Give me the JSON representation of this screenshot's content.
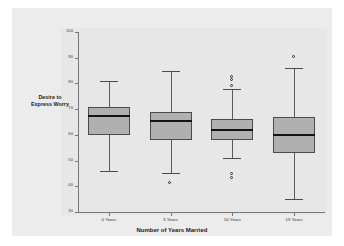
{
  "chart_data": {
    "type": "box",
    "title": "",
    "xlabel": "Number of Years Married",
    "ylabel": "Desire to Express Worry",
    "ylim": [
      30,
      100
    ],
    "yticks": [
      100,
      90,
      80,
      70,
      60,
      50,
      40,
      30
    ],
    "ytick_labels": [
      "100",
      "90",
      "80",
      "70",
      "60",
      "50",
      "40",
      "30"
    ],
    "grid": false,
    "legend": "none",
    "categories": [
      "0 Years",
      "5 Years",
      "10 Years",
      "15 Years"
    ],
    "boxes": [
      {
        "category": "0 Years",
        "whisker_low": 46,
        "q1": 60,
        "median": 67.5,
        "q3": 71,
        "whisker_high": 81,
        "outliers": []
      },
      {
        "category": "5 Years",
        "whisker_low": 45,
        "q1": 58,
        "median": 65.5,
        "q3": 69,
        "whisker_high": 85,
        "outliers": [
          41
        ]
      },
      {
        "category": "10 Years",
        "whisker_low": 51,
        "q1": 58,
        "median": 62,
        "q3": 66,
        "whisker_high": 78,
        "outliers": [
          82.5,
          81,
          79,
          44.5,
          43
        ]
      },
      {
        "category": "15 Years",
        "whisker_low": 35,
        "q1": 53,
        "median": 60,
        "q3": 67,
        "whisker_high": 86,
        "outliers": [
          90
        ]
      }
    ],
    "colors": {
      "box_fill": "#b0b0b0",
      "box_edge": "#4b4b4d",
      "median": "#131314",
      "whisker": "#5a5a5c",
      "panel_bg": "#e7e7e8",
      "figure_bg": "#ececed",
      "axis": "#77777a"
    }
  }
}
